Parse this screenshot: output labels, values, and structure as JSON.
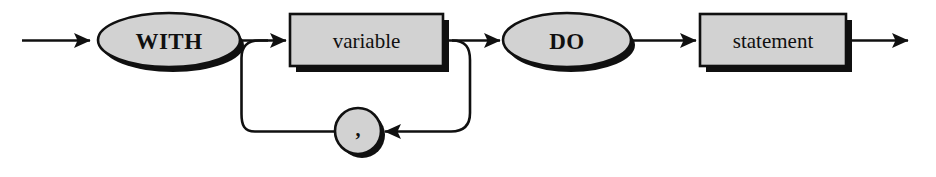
{
  "diagram": {
    "kind": "syntax-railroad-diagram",
    "colors": {
      "background": "#ffffff",
      "line": "#101010",
      "node_fill": "#d2d2d2",
      "node_stroke": "#101010",
      "shadow": "#101010",
      "text": "#101010"
    },
    "nodes": [
      {
        "id": "with-keyword",
        "shape": "ellipse",
        "type": "terminal",
        "label": "WITH",
        "cx": 169,
        "cy": 40,
        "rx": 71,
        "ry": 27
      },
      {
        "id": "variable-nonterminal",
        "shape": "rect",
        "type": "nonterminal",
        "label": "variable",
        "x": 290,
        "y": 14,
        "width": 153,
        "height": 52
      },
      {
        "id": "do-keyword",
        "shape": "ellipse",
        "type": "terminal",
        "label": "DO",
        "cx": 567,
        "cy": 40,
        "rx": 64,
        "ry": 27
      },
      {
        "id": "statement-nonterminal",
        "shape": "rect",
        "type": "nonterminal",
        "label": "statement",
        "x": 700,
        "y": 14,
        "width": 146,
        "height": 52
      },
      {
        "id": "comma-separator",
        "shape": "circle",
        "type": "terminal",
        "label": ",",
        "cx": 358,
        "cy": 131,
        "r": 23
      }
    ],
    "edges": [
      {
        "id": "entry-line",
        "from": "start",
        "to": "with-keyword",
        "arrow": true
      },
      {
        "id": "with-to-variable",
        "from": "with-keyword",
        "to": "variable-nonterminal",
        "arrow": true
      },
      {
        "id": "variable-to-do",
        "from": "variable-nonterminal",
        "to": "do-keyword",
        "arrow": true
      },
      {
        "id": "do-to-statement",
        "from": "do-keyword",
        "to": "statement-nonterminal",
        "arrow": true
      },
      {
        "id": "exit-line",
        "from": "statement-nonterminal",
        "to": "end",
        "arrow": true
      },
      {
        "id": "loop-down-right",
        "from": "variable-nonterminal",
        "to": "comma-separator",
        "arrow": true
      },
      {
        "id": "loop-up-left",
        "from": "comma-separator",
        "to": "with-to-variable",
        "arrow": false
      }
    ],
    "sequence": [
      "WITH",
      "variable",
      "DO",
      "statement"
    ],
    "repetition": {
      "element": "variable",
      "separator": ","
    }
  }
}
